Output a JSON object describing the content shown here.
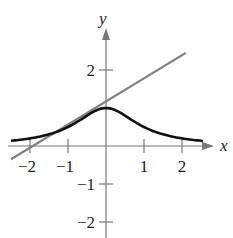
{
  "chart_data": {
    "type": "line",
    "title": "",
    "xlabel": "x",
    "ylabel": "y",
    "xlim": [
      -2.5,
      2.7
    ],
    "ylim": [
      -2.3,
      2.9
    ],
    "grid": false,
    "x_ticks": [
      -2,
      -1,
      1,
      2
    ],
    "x_tick_labels": [
      "−2",
      "−1",
      "1",
      "2"
    ],
    "y_ticks": [
      2,
      -1,
      -2
    ],
    "y_tick_labels": [
      "2",
      "−1",
      "−2"
    ],
    "series": [
      {
        "name": "curve",
        "style": "solid",
        "color": "#111111",
        "x": [
          -2.5,
          -2,
          -1.5,
          -1,
          -0.5,
          0,
          0.5,
          1,
          1.5,
          2,
          2.5
        ],
        "y": [
          0.06,
          0.13,
          0.28,
          0.5,
          0.8,
          1.0,
          0.8,
          0.5,
          0.28,
          0.13,
          0.06
        ]
      },
      {
        "name": "tangent-line",
        "style": "solid",
        "color": "#808080",
        "x": [
          -2.5,
          2.1
        ],
        "y": [
          -0.35,
          2.45
        ]
      }
    ]
  },
  "axes": {
    "x_label": "x",
    "y_label": "y"
  },
  "colors": {
    "curve": "#111111",
    "line": "#808080",
    "axis": "#777777"
  }
}
